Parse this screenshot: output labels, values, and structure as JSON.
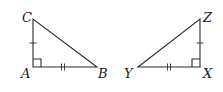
{
  "diagram": {
    "type": "congruent-right-triangles",
    "colors": {
      "stroke": "#2a2a2a",
      "label": "#222222",
      "background": "#ffffff"
    },
    "triangles": [
      {
        "name": "ABC",
        "vertices": {
          "C": {
            "label": "C",
            "x": 33,
            "y": 19
          },
          "A": {
            "label": "A",
            "x": 33,
            "y": 67
          },
          "B": {
            "label": "B",
            "x": 97,
            "y": 67
          }
        },
        "right_angle_at": "A",
        "marks": [
          {
            "side": "AC",
            "ticks": 1
          },
          {
            "side": "AB",
            "ticks": 2
          }
        ]
      },
      {
        "name": "XYZ",
        "vertices": {
          "Z": {
            "label": "Z",
            "x": 200,
            "y": 19
          },
          "X": {
            "label": "X",
            "x": 200,
            "y": 67
          },
          "Y": {
            "label": "Y",
            "x": 138,
            "y": 67
          }
        },
        "right_angle_at": "X",
        "marks": [
          {
            "side": "XZ",
            "ticks": 1
          },
          {
            "side": "XY",
            "ticks": 2
          }
        ]
      }
    ]
  }
}
